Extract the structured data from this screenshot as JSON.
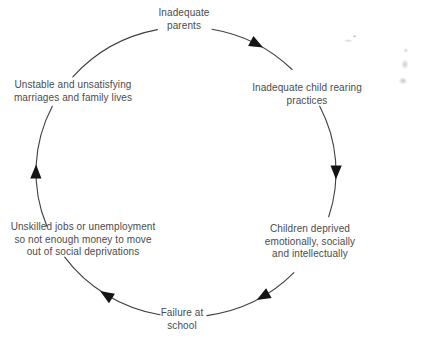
{
  "diagram": {
    "title": "",
    "type": "cycle",
    "direction": "clockwise",
    "nodes": [
      {
        "id": "inadequate-parents",
        "label": "Inadequate\nparents"
      },
      {
        "id": "child-rearing-practices",
        "label": "Inadequate child rearing\npractices"
      },
      {
        "id": "children-deprived",
        "label": "Children deprived\nemotionally, socially\nand intellectually"
      },
      {
        "id": "failure-at-school",
        "label": "Failure at\nschool"
      },
      {
        "id": "unskilled-jobs",
        "label": "Unskilled jobs or unemployment\nso not enough money to move\nout of social deprivations"
      },
      {
        "id": "unstable-marriages",
        "label": "Unstable and unsatisfying\nmarriages and family lives"
      }
    ],
    "edges": [
      {
        "from": "inadequate-parents",
        "to": "child-rearing-practices",
        "arrow": true
      },
      {
        "from": "child-rearing-practices",
        "to": "children-deprived",
        "arrow": true
      },
      {
        "from": "children-deprived",
        "to": "failure-at-school",
        "arrow": true
      },
      {
        "from": "failure-at-school",
        "to": "unskilled-jobs",
        "arrow": true
      },
      {
        "from": "unskilled-jobs",
        "to": "unstable-marriages",
        "arrow": true
      },
      {
        "from": "unstable-marriages",
        "to": "inadequate-parents",
        "arrow": false
      }
    ],
    "colors": {
      "background": "#ffffff",
      "text": "#4b4b4d",
      "line": "#3f3f41",
      "arrow": "#141414"
    }
  }
}
